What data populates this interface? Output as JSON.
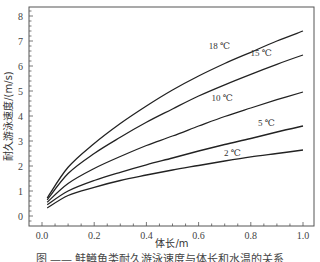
{
  "chart_data": {
    "type": "line",
    "title": "",
    "xlabel": "体长/m",
    "ylabel": "耐久游泳速度/(m/s)",
    "xlim": [
      -0.05,
      1.05
    ],
    "ylim": [
      -0.4,
      8.4
    ],
    "xticks": [
      0.0,
      0.2,
      0.4,
      0.6,
      0.8,
      1.0
    ],
    "xtick_labels": [
      "0.0",
      "0.2",
      "0.4",
      "0.6",
      "0.8",
      "1.0"
    ],
    "yticks": [
      0,
      1,
      2,
      3,
      4,
      5,
      6,
      7,
      8
    ],
    "ytick_labels": [
      "0",
      "1",
      "2",
      "3",
      "4",
      "5",
      "6",
      "7",
      "8"
    ],
    "grid": false,
    "legend": "inline labels near curves",
    "x": [
      0.02,
      0.1,
      0.2,
      0.3,
      0.4,
      0.5,
      0.6,
      0.7,
      0.8,
      0.9,
      1.0
    ],
    "series": [
      {
        "name": "18 ℃",
        "values": [
          0.72,
          1.95,
          2.9,
          3.7,
          4.4,
          5.04,
          5.6,
          6.1,
          6.55,
          7.0,
          7.4
        ]
      },
      {
        "name": "15 ℃",
        "values": [
          0.65,
          1.7,
          2.5,
          3.15,
          3.75,
          4.28,
          4.8,
          5.25,
          5.67,
          6.07,
          6.44
        ]
      },
      {
        "name": "10 ℃",
        "values": [
          0.55,
          1.3,
          1.9,
          2.38,
          2.82,
          3.2,
          3.6,
          3.98,
          4.32,
          4.65,
          4.96
        ]
      },
      {
        "name": "5 ℃",
        "values": [
          0.45,
          1.0,
          1.42,
          1.75,
          2.05,
          2.32,
          2.6,
          2.86,
          3.1,
          3.36,
          3.6
        ]
      },
      {
        "name": "2 ℃",
        "values": [
          0.32,
          0.82,
          1.15,
          1.42,
          1.64,
          1.84,
          2.02,
          2.2,
          2.37,
          2.5,
          2.64
        ]
      }
    ],
    "annotations": [
      {
        "text": "18 ℃",
        "x": 0.68,
        "y": 6.7
      },
      {
        "text": "15 ℃",
        "x": 0.84,
        "y": 6.4
      },
      {
        "text": "10 ℃",
        "x": 0.69,
        "y": 4.6
      },
      {
        "text": "5 ℃",
        "x": 0.86,
        "y": 3.6
      },
      {
        "text": "2 ℃",
        "x": 0.73,
        "y": 2.4
      }
    ]
  },
  "caption": "图 —— 鲑鳟鱼类耐久游泳速度与体长和水温的关系"
}
